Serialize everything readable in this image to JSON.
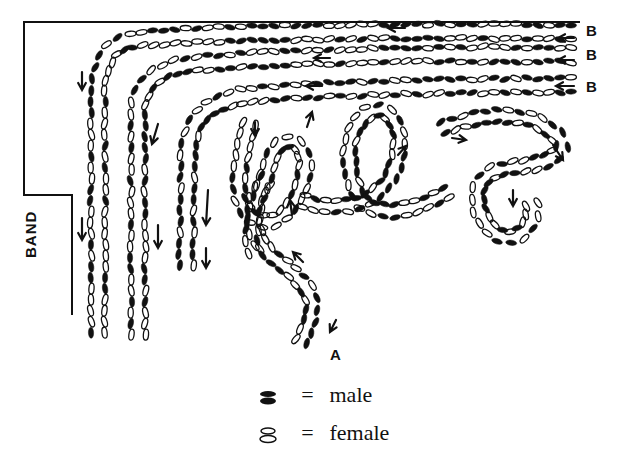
{
  "diagram": {
    "labels": {
      "entry_right": [
        "B",
        "B",
        "B"
      ],
      "entry_bottom": "A",
      "band": "BAND"
    },
    "legend": [
      {
        "symbol": "filled-ellipse-pair",
        "eq": "=",
        "meaning": "male"
      },
      {
        "symbol": "outline-ellipse-pair",
        "eq": "=",
        "meaning": "female"
      }
    ],
    "colors": {
      "ink": "#111111",
      "paper": "#ffffff"
    }
  }
}
